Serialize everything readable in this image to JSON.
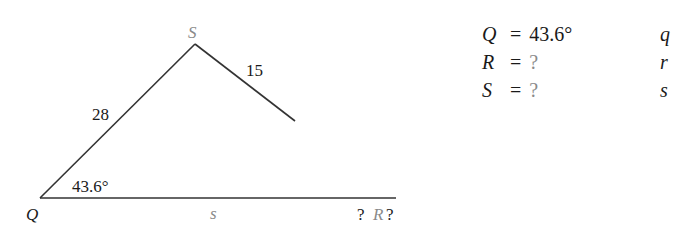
{
  "diagram": {
    "vertices": {
      "Q": {
        "label": "Q",
        "color": "#1a1a1a"
      },
      "S": {
        "label": "S",
        "color": "#8a8a8a"
      },
      "R": {
        "label": "R",
        "color": "#8a8a8a"
      }
    },
    "sides": {
      "QS": "28",
      "SR": "15",
      "QR": "s"
    },
    "angle_Q": "43.6°",
    "ambiguous_marks": {
      "left": "?",
      "right": "?"
    },
    "line_color": "#333333"
  },
  "givens": [
    {
      "name": "Q",
      "eq": "=",
      "value": "43.6°",
      "known": true
    },
    {
      "name": "R",
      "eq": "=",
      "value": "?",
      "known": false
    },
    {
      "name": "S",
      "eq": "=",
      "value": "?",
      "known": false
    }
  ],
  "side_labels": [
    {
      "name": "q"
    },
    {
      "name": "r"
    },
    {
      "name": "s"
    }
  ]
}
